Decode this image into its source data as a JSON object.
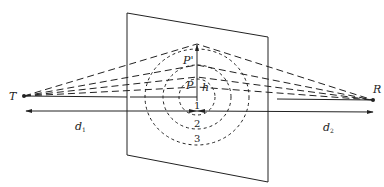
{
  "diagram": {
    "type": "fresnel-zone-geometry",
    "nodes": {
      "transmitter": {
        "label": "T",
        "x": 24,
        "y": 96
      },
      "receiver": {
        "label": "R",
        "x": 373,
        "y": 100
      },
      "point_p": {
        "label": "P"
      },
      "point_p_prime": {
        "label": "P'"
      }
    },
    "labels": {
      "height": "h",
      "distance_left": "d",
      "distance_left_sub": "1",
      "distance_right": "d",
      "distance_right_sub": "2"
    },
    "zones": [
      {
        "label": "1"
      },
      {
        "label": "2"
      },
      {
        "label": "3"
      }
    ],
    "colors": {
      "stroke": "#222222",
      "background": "#ffffff"
    }
  }
}
